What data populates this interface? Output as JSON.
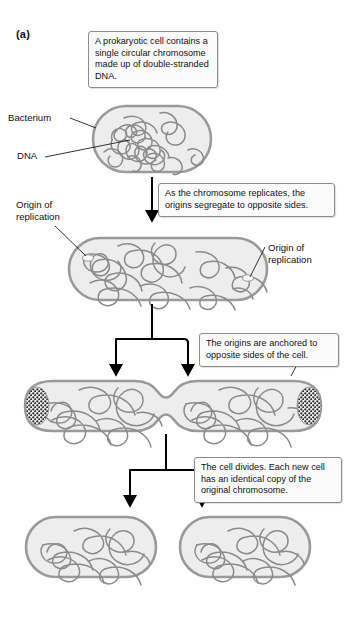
{
  "figure": {
    "panel_label": "(a)"
  },
  "callouts": [
    {
      "id": "callout-1",
      "text": "A prokaryotic cell contains a single circular chromosome made up of double-stranded DNA."
    },
    {
      "id": "callout-2",
      "text": "As the chromosome replicates, the origins segregate to opposite sides."
    },
    {
      "id": "callout-3",
      "text": "The origins are anchored to opposite sides of the cell."
    },
    {
      "id": "callout-4",
      "text": "The cell divides. Each new cell has an identical copy of the original chromosome."
    }
  ],
  "labels": {
    "bacterium": "Bacterium",
    "dna": "DNA",
    "origin_left": "Origin of\nreplication",
    "origin_right": "Origin of\nreplication"
  },
  "colors": {
    "cell_fill": "#ededed",
    "cell_stroke": "#9a9a9a",
    "dna_stroke": "#8b8b8b",
    "callout_border": "#8d8d8d",
    "callout_fill": "#fbfbfb",
    "arrow": "#000000",
    "origin_patch": "#2b2b2b"
  },
  "stages": [
    {
      "name": "single-bacterium",
      "caption_ref": "callout-1",
      "cells": 1
    },
    {
      "name": "replicated-chromosome",
      "caption_ref": "callout-2",
      "cells": 1
    },
    {
      "name": "dividing-cell",
      "caption_ref": "callout-3",
      "cells": 1
    },
    {
      "name": "daughter-cells",
      "caption_ref": "callout-4",
      "cells": 2
    }
  ]
}
